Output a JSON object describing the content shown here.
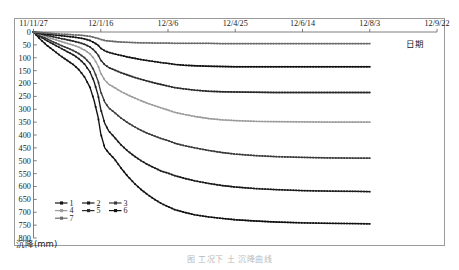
{
  "figure": {
    "caption": "图        工况下     土     沉降曲线",
    "y_axis_title": "沉降(mm)",
    "x_axis_title": "日期"
  },
  "chart_data": {
    "type": "line",
    "title": "",
    "xlabel": "日期",
    "ylabel": "沉降(mm)",
    "y_inverted": true,
    "ylim": [
      0,
      800
    ],
    "y_ticks": [
      0,
      50,
      100,
      150,
      200,
      250,
      300,
      350,
      400,
      450,
      500,
      550,
      600,
      650,
      700,
      750,
      800
    ],
    "x_ticks": [
      "11/11/27",
      "12/1/16",
      "12/3/6",
      "12/4/25",
      "12/6/14",
      "12/8/3",
      "12/9/22"
    ],
    "x_tick_days": [
      0,
      50,
      100,
      150,
      200,
      250,
      300
    ],
    "grid": false,
    "legend_position": "inner-bottom-left",
    "x": [
      0,
      5,
      10,
      15,
      20,
      25,
      30,
      34,
      38,
      42,
      45,
      48,
      50,
      53,
      56,
      60,
      65,
      70,
      75,
      80,
      85,
      90,
      95,
      100,
      105,
      112,
      120,
      130,
      140,
      150,
      165,
      180,
      200,
      220,
      240,
      250
    ],
    "series": [
      {
        "name": "1",
        "label": "1",
        "color": "#111111",
        "marker": "diamond",
        "final_value": 745,
        "values": [
          0,
          28,
          52,
          72,
          92,
          110,
          128,
          148,
          175,
          215,
          265,
          330,
          395,
          450,
          470,
          492,
          528,
          560,
          588,
          612,
          632,
          650,
          666,
          678,
          690,
          700,
          710,
          718,
          724,
          729,
          734,
          738,
          741,
          743,
          744,
          745
        ]
      },
      {
        "name": "2",
        "label": "2",
        "color": "#1a1a1a",
        "marker": "square",
        "final_value": 620,
        "values": [
          0,
          18,
          34,
          48,
          62,
          76,
          90,
          105,
          125,
          155,
          192,
          245,
          300,
          355,
          385,
          408,
          438,
          462,
          482,
          500,
          515,
          528,
          540,
          548,
          558,
          568,
          578,
          588,
          596,
          602,
          608,
          612,
          616,
          618,
          619,
          620
        ]
      },
      {
        "name": "3",
        "label": "3",
        "color": "#3a3a3a",
        "marker": "triangle",
        "final_value": 490,
        "values": [
          0,
          14,
          27,
          39,
          51,
          62,
          73,
          85,
          100,
          122,
          150,
          190,
          232,
          272,
          295,
          312,
          334,
          352,
          368,
          382,
          394,
          404,
          414,
          422,
          432,
          441,
          450,
          460,
          468,
          474,
          480,
          484,
          487,
          489,
          490,
          490
        ]
      },
      {
        "name": "4",
        "label": "4",
        "color": "#9c9c9c",
        "marker": "cross",
        "final_value": 350,
        "values": [
          0,
          10,
          19,
          28,
          36,
          44,
          52,
          60,
          70,
          85,
          104,
          131,
          160,
          187,
          203,
          215,
          231,
          244,
          256,
          267,
          277,
          286,
          295,
          303,
          312,
          320,
          328,
          336,
          341,
          344,
          347,
          348,
          349,
          350,
          350,
          350
        ]
      },
      {
        "name": "5",
        "label": "5",
        "color": "#2a2a2a",
        "marker": "dash",
        "final_value": 235,
        "values": [
          0,
          7,
          13,
          19,
          25,
          30,
          36,
          41,
          48,
          58,
          71,
          89,
          109,
          127,
          138,
          147,
          158,
          167,
          176,
          184,
          191,
          198,
          204,
          210,
          216,
          221,
          226,
          230,
          232,
          233,
          234,
          235,
          235,
          235,
          235,
          235
        ]
      },
      {
        "name": "6",
        "label": "6",
        "color": "#121212",
        "marker": "circle",
        "final_value": 135,
        "values": [
          0,
          4,
          8,
          11,
          14,
          17,
          20,
          23,
          27,
          33,
          41,
          51,
          63,
          73,
          79,
          85,
          91,
          97,
          102,
          107,
          111,
          115,
          119,
          122,
          126,
          129,
          131,
          133,
          134,
          135,
          135,
          135,
          135,
          135,
          135,
          135
        ]
      },
      {
        "name": "7",
        "label": "7",
        "color": "#6b6b6b",
        "marker": "line",
        "final_value": 45,
        "values": [
          0,
          2,
          4,
          6,
          8,
          9,
          11,
          12,
          14,
          17,
          21,
          25,
          29,
          33,
          35,
          37,
          39,
          40,
          41,
          42,
          42,
          43,
          43,
          43,
          44,
          44,
          44,
          44,
          45,
          45,
          45,
          45,
          45,
          45,
          45,
          45
        ]
      }
    ],
    "legend": [
      {
        "label": "1",
        "color": "#111111"
      },
      {
        "label": "2",
        "color": "#1a1a1a"
      },
      {
        "label": "3",
        "color": "#3a3a3a"
      },
      {
        "label": "4",
        "color": "#9c9c9c"
      },
      {
        "label": "5",
        "color": "#2a2a2a"
      },
      {
        "label": "6",
        "color": "#121212"
      },
      {
        "label": "7",
        "color": "#6b6b6b"
      }
    ]
  }
}
